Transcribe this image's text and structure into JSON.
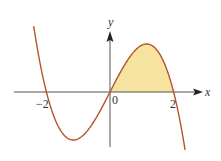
{
  "diagram": {
    "type": "function-graph",
    "function": "cubic with roots at -2, 0, 2; shaded area between curve and x-axis on [0, 2]",
    "labels": {
      "x_axis": "x",
      "y_axis": "y",
      "origin": "0",
      "tick_neg2": "−2",
      "tick_2": "2"
    },
    "colors": {
      "curve": "#b5532a",
      "fill": "#f7e3a0",
      "axes": "#555555"
    }
  }
}
